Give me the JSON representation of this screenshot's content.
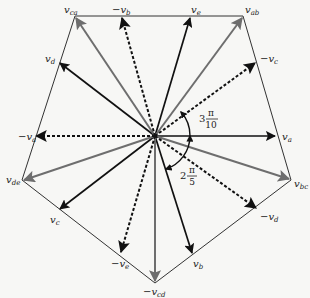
{
  "diagram": {
    "title": "",
    "center": [
      155,
      136
    ],
    "colors": {
      "background": "#f7f7f5",
      "black_vector": "#111111",
      "gray_vector": "#6e6e6e",
      "outline": "#333333"
    },
    "pentagon_vertices": [
      {
        "name": "v_ca",
        "x": 75,
        "y": 16
      },
      {
        "name": "v_ab",
        "x": 243,
        "y": 16
      },
      {
        "name": "v_bc",
        "x": 291,
        "y": 180
      },
      {
        "name": "v_cd",
        "x": 155,
        "y": 283
      },
      {
        "name": "v_de",
        "x": 22,
        "y": 180
      }
    ],
    "vectors": [
      {
        "id": "va",
        "style": "black-solid",
        "x": 275,
        "y": 136,
        "label": {
          "sign": "",
          "base": "v",
          "sub": "a",
          "x": 282,
          "y": 140
        }
      },
      {
        "id": "vbc",
        "style": "gray-solid",
        "x": 289,
        "y": 179,
        "label": {
          "sign": "",
          "base": "v",
          "sub": "bc",
          "x": 294,
          "y": 187
        }
      },
      {
        "id": "neg-vd",
        "style": "black-dashed",
        "x": 256,
        "y": 208,
        "label": {
          "sign": "−",
          "base": "v",
          "sub": "d",
          "x": 260,
          "y": 220
        }
      },
      {
        "id": "vb",
        "style": "black-solid",
        "x": 192,
        "y": 253,
        "label": {
          "sign": "",
          "base": "v",
          "sub": "b",
          "x": 193,
          "y": 267
        }
      },
      {
        "id": "neg-vcd",
        "style": "gray-solid",
        "x": 155,
        "y": 281,
        "label": {
          "sign": "−",
          "base": "v",
          "sub": "cd",
          "x": 143,
          "y": 295
        }
      },
      {
        "id": "neg-ve",
        "style": "black-dashed",
        "x": 121,
        "y": 252,
        "label": {
          "sign": "−",
          "base": "v",
          "sub": "e",
          "x": 111,
          "y": 267
        }
      },
      {
        "id": "vc",
        "style": "black-solid",
        "x": 60,
        "y": 209,
        "label": {
          "sign": "",
          "base": "v",
          "sub": "c",
          "x": 50,
          "y": 223
        }
      },
      {
        "id": "vde",
        "style": "gray-solid",
        "x": 24,
        "y": 180,
        "label": {
          "sign": "",
          "base": "v",
          "sub": "de",
          "x": 6,
          "y": 183
        }
      },
      {
        "id": "neg-va",
        "style": "black-dashed",
        "x": 36,
        "y": 136,
        "label": {
          "sign": "−",
          "base": "v",
          "sub": "a",
          "x": 18,
          "y": 140
        }
      },
      {
        "id": "vd",
        "style": "black-solid",
        "x": 60,
        "y": 63,
        "label": {
          "sign": "",
          "base": "v",
          "sub": "d",
          "x": 45,
          "y": 62
        }
      },
      {
        "id": "vca",
        "style": "gray-solid",
        "x": 76,
        "y": 18,
        "label": {
          "sign": "",
          "base": "v",
          "sub": "ca",
          "x": 64,
          "y": 13
        }
      },
      {
        "id": "neg-vb",
        "style": "black-dashed",
        "x": 122,
        "y": 18,
        "label": {
          "sign": "−",
          "base": "v",
          "sub": "b",
          "x": 112,
          "y": 13
        }
      },
      {
        "id": "ve",
        "style": "black-solid",
        "x": 190,
        "y": 18,
        "label": {
          "sign": "",
          "base": "v",
          "sub": "e",
          "x": 191,
          "y": 13
        }
      },
      {
        "id": "vab",
        "style": "gray-solid",
        "x": 242,
        "y": 18,
        "label": {
          "sign": "",
          "base": "v",
          "sub": "ab",
          "x": 245,
          "y": 13
        }
      },
      {
        "id": "neg-vc",
        "style": "black-dashed",
        "x": 255,
        "y": 63,
        "label": {
          "sign": "−",
          "base": "v",
          "sub": "c",
          "x": 260,
          "y": 62
        }
      }
    ],
    "angles": [
      {
        "id": "angle-3pi-10",
        "coef": "3",
        "num": "π",
        "den": "10",
        "x": 199,
        "y": 118
      },
      {
        "id": "angle-2pi-5",
        "coef": "2",
        "num": "π",
        "den": "5",
        "x": 180,
        "y": 175
      }
    ]
  }
}
